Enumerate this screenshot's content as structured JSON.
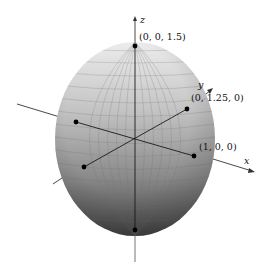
{
  "figure": {
    "type": "3d-ellipsoid",
    "equation_semi_axes": {
      "a": 1,
      "b": 1.25,
      "c": 1.5
    },
    "colors": {
      "surface_top": "#e6e6e6",
      "surface_mid": "#a8a8a8",
      "surface_bottom": "#454545",
      "mesh": "#7a7a7a",
      "axis": "#222222",
      "point": "#000000"
    },
    "axes": {
      "x": {
        "label": "x"
      },
      "y": {
        "label": "y"
      },
      "z": {
        "label": "z"
      }
    },
    "points": [
      {
        "id": "z-top",
        "label": "(0, 0, 1.5)"
      },
      {
        "id": "y-pos",
        "label": "(0, 1.25, 0)"
      },
      {
        "id": "x-pos",
        "label": "(1, 0, 0)"
      },
      {
        "id": "x-neg",
        "label": ""
      },
      {
        "id": "y-neg",
        "label": ""
      },
      {
        "id": "z-bottom",
        "label": ""
      }
    ]
  }
}
